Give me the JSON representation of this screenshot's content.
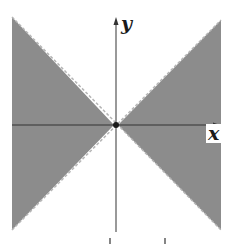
{
  "figure": {
    "x_axis_label": "x",
    "y_axis_label": "y",
    "colors": {
      "shade": "#8c8c8c",
      "boundary": "#b5b5b5",
      "axis": "#333333",
      "background": "#ffffff"
    },
    "boundaries": [
      {
        "equation": "y = x",
        "style": "dashed"
      },
      {
        "equation": "y = -x",
        "style": "dashed"
      }
    ],
    "origin_point": "filled-dot"
  }
}
